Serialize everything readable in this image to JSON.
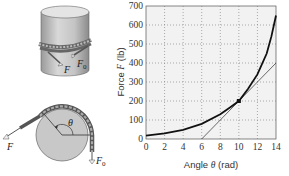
{
  "diagram": {
    "cylinder_labels": {
      "force": "F",
      "force0": "F",
      "force0_sub": "0"
    },
    "disk_labels": {
      "force": "F",
      "force0": "F",
      "force0_sub": "0",
      "angle": "θ"
    }
  },
  "chart_data": {
    "type": "line",
    "title": "",
    "xlabel": "Angle θ (rad)",
    "ylabel": "Force F (lb)",
    "xlim": [
      0,
      14
    ],
    "ylim": [
      0,
      700
    ],
    "xticks": [
      0,
      2,
      4,
      6,
      8,
      10,
      12,
      14
    ],
    "yticks": [
      0,
      100,
      200,
      300,
      400,
      500,
      600,
      700
    ],
    "grid": true,
    "series": [
      {
        "name": "Force curve",
        "x": [
          0,
          2,
          4,
          6,
          8,
          9,
          10,
          11,
          12,
          13,
          13.5,
          14
        ],
        "y": [
          18,
          30,
          48,
          80,
          130,
          165,
          200,
          265,
          340,
          450,
          540,
          650
        ]
      },
      {
        "name": "Tangent at θ=10",
        "x": [
          6,
          14
        ],
        "y": [
          0,
          400
        ]
      }
    ],
    "annotations": [
      {
        "type": "point",
        "x": 10,
        "y": 200
      }
    ]
  }
}
